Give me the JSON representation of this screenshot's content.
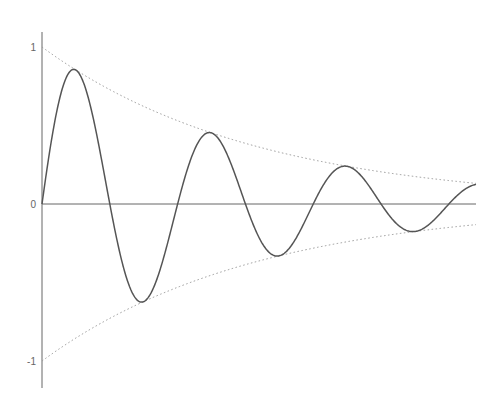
{
  "chart_data": {
    "type": "line",
    "title": "",
    "xlabel": "",
    "ylabel": "",
    "ylim": [
      -1.1,
      1.1
    ],
    "xlim": [
      0,
      6.4
    ],
    "yticks": [
      {
        "value": 1,
        "label": "1"
      },
      {
        "value": 0,
        "label": "0"
      },
      {
        "value": -1,
        "label": "-1"
      }
    ],
    "grid": false,
    "legend": null,
    "period": 2.0,
    "decay_rate": 0.317,
    "series": [
      {
        "name": "damped-sine",
        "style": "solid",
        "color": "#555555",
        "x": [
          0,
          0.5,
          1.0,
          1.5,
          2.0,
          2.5,
          3.0,
          3.5,
          4.0,
          4.5,
          5.0,
          5.5,
          6.0,
          6.4
        ],
        "values": [
          0,
          0.86,
          0,
          -0.62,
          0,
          0.46,
          0,
          -0.33,
          0,
          0.24,
          0,
          -0.17,
          0,
          0.13
        ]
      },
      {
        "name": "upper-envelope",
        "style": "dotted",
        "color": "#999999",
        "x": [
          0,
          1,
          2,
          3,
          4,
          5,
          6,
          6.4
        ],
        "values": [
          1,
          0.73,
          0.53,
          0.39,
          0.28,
          0.21,
          0.15,
          0.13
        ]
      },
      {
        "name": "lower-envelope",
        "style": "dotted",
        "color": "#999999",
        "x": [
          0,
          1,
          2,
          3,
          4,
          5,
          6,
          6.4
        ],
        "values": [
          -1,
          -0.73,
          -0.53,
          -0.39,
          -0.28,
          -0.21,
          -0.15,
          -0.13
        ]
      }
    ]
  },
  "colors": {
    "axis": "#666666",
    "curve": "#555555",
    "envelope": "#999999"
  }
}
